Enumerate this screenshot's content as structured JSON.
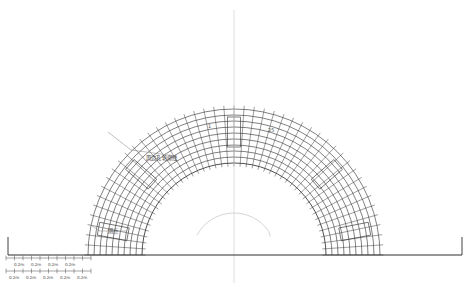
{
  "drawing": {
    "type": "tunnel-cross-section-blast-hole-layout",
    "background_color": "#ffffff",
    "line_color": "#3c3c3c",
    "light_line_color": "#b8b8b8",
    "baseline_color": "#2e2e2e",
    "centerline_color": "#d0d0d0"
  },
  "annotations": {
    "peripheral_hole_contour": {
      "label": "周边孔轮廓线",
      "x": 146,
      "y": 156
    },
    "measuring_point": {
      "label": "测点",
      "x": 108,
      "y": 229
    }
  },
  "sequence_labels": {
    "start": "1",
    "end": "25",
    "start_x": 208,
    "start_y": 124,
    "end_x": 268,
    "end_y": 128
  },
  "dimensions": {
    "unit_label": "0.2m",
    "row_upper": {
      "y_ticks": 258,
      "y_text": 263,
      "labels": [
        "0.2m",
        "0.2m",
        "0.2m",
        "0.2m"
      ],
      "label_x": [
        14,
        31,
        48,
        65
      ]
    },
    "row_lower": {
      "y_ticks": 271,
      "y_text": 276,
      "labels": [
        "0.2m",
        "0.2m",
        "0.2m",
        "0.2m",
        "0.2m"
      ],
      "label_x": [
        9,
        26,
        43,
        60,
        77
      ]
    }
  },
  "geometry": {
    "center_x": 234,
    "center_y": 255,
    "arc_count": 10,
    "arc_radii": [
      92,
      98,
      104,
      110,
      116,
      122,
      128,
      134,
      140,
      146
    ],
    "baseline": {
      "x1": 8,
      "x2": 462,
      "y": 255
    },
    "centerline": {
      "x": 234,
      "y1": 10,
      "y2": 283
    },
    "rect_markers": [
      {
        "name": "crown-marker",
        "angle_deg": 90
      },
      {
        "name": "upper-left-marker",
        "angle_deg": 139
      },
      {
        "name": "upper-right-marker",
        "angle_deg": 41
      },
      {
        "name": "lower-left-marker",
        "angle_deg": 169
      },
      {
        "name": "lower-right-marker",
        "angle_deg": 11
      }
    ]
  }
}
